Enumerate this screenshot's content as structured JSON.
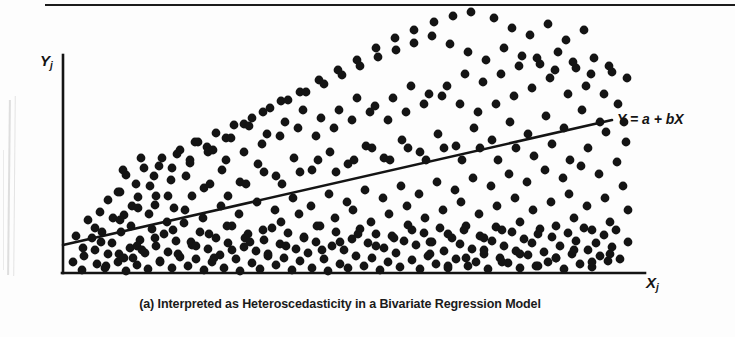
{
  "figure": {
    "caption": "(a) Interpreted as Heteroscedasticity in a Bivariate Regression Model",
    "line_equation": "Y = a + bX",
    "y_axis_label": "Y",
    "y_axis_subscript": "j",
    "x_axis_label": "X",
    "x_axis_subscript": "j",
    "ink_color": "#141414",
    "background_color": "#fdfdfd"
  },
  "chart_data": {
    "type": "scatter",
    "title": "",
    "subtitle": "(a) Interpreted as Heteroscedasticity in a Bivariate Regression Model",
    "xlabel": "X_j",
    "ylabel": "Y_j",
    "grid": false,
    "legend": false,
    "annotations": [
      {
        "text": "Y = a + bX",
        "x": 617,
        "y": 118,
        "role": "regression-line-label"
      }
    ],
    "axes": {
      "x_axis_pixels": {
        "x0": 63,
        "x1": 645,
        "y": 273
      },
      "y_axis_pixels": {
        "x": 63,
        "y0": 55,
        "y1": 273
      },
      "xlim": [
        0,
        100
      ],
      "ylim": [
        0,
        100
      ],
      "ticks": false
    },
    "regression_line": {
      "label": "Y = a + bX",
      "intercept_pixel": {
        "x": 63,
        "y": 245
      },
      "endpoint_pixel": {
        "x": 612,
        "y": 120
      },
      "stroke_width": 2.6,
      "color": "#141414"
    },
    "marker": {
      "shape": "circle",
      "radius_px": 4.4,
      "color": "#141414"
    },
    "points": [
      [
        73,
        262
      ],
      [
        84,
        256
      ],
      [
        82,
        270
      ],
      [
        95,
        250
      ],
      [
        97,
        264
      ],
      [
        92,
        238
      ],
      [
        105,
        268
      ],
      [
        108,
        254
      ],
      [
        112,
        243
      ],
      [
        118,
        262
      ],
      [
        121,
        232
      ],
      [
        126,
        271
      ],
      [
        130,
        248
      ],
      [
        133,
        258
      ],
      [
        124,
        215
      ],
      [
        137,
        265
      ],
      [
        140,
        240
      ],
      [
        145,
        253
      ],
      [
        148,
        269
      ],
      [
        152,
        229
      ],
      [
        138,
        197
      ],
      [
        156,
        246
      ],
      [
        160,
        261
      ],
      [
        164,
        234
      ],
      [
        168,
        252
      ],
      [
        172,
        268
      ],
      [
        176,
        241
      ],
      [
        180,
        257
      ],
      [
        155,
        205
      ],
      [
        184,
        223
      ],
      [
        188,
        266
      ],
      [
        192,
        245
      ],
      [
        196,
        259
      ],
      [
        200,
        232
      ],
      [
        204,
        270
      ],
      [
        208,
        249
      ],
      [
        171,
        180
      ],
      [
        212,
        262
      ],
      [
        216,
        238
      ],
      [
        220,
        255
      ],
      [
        224,
        268
      ],
      [
        228,
        243
      ],
      [
        232,
        226
      ],
      [
        236,
        259
      ],
      [
        240,
        271
      ],
      [
        190,
        163
      ],
      [
        244,
        247
      ],
      [
        248,
        234
      ],
      [
        252,
        263
      ],
      [
        256,
        251
      ],
      [
        260,
        269
      ],
      [
        264,
        240
      ],
      [
        268,
        256
      ],
      [
        207,
        147
      ],
      [
        272,
        228
      ],
      [
        276,
        265
      ],
      [
        280,
        244
      ],
      [
        284,
        258
      ],
      [
        288,
        233
      ],
      [
        292,
        270
      ],
      [
        296,
        249
      ],
      [
        226,
        138
      ],
      [
        300,
        261
      ],
      [
        304,
        237
      ],
      [
        308,
        253
      ],
      [
        312,
        268
      ],
      [
        316,
        242
      ],
      [
        320,
        226
      ],
      [
        324,
        259
      ],
      [
        244,
        124
      ],
      [
        328,
        271
      ],
      [
        332,
        246
      ],
      [
        336,
        232
      ],
      [
        340,
        264
      ],
      [
        344,
        250
      ],
      [
        348,
        268
      ],
      [
        352,
        239
      ],
      [
        263,
        112
      ],
      [
        356,
        256
      ],
      [
        360,
        229
      ],
      [
        364,
        266
      ],
      [
        368,
        243
      ],
      [
        372,
        258
      ],
      [
        376,
        234
      ],
      [
        380,
        270
      ],
      [
        281,
        101
      ],
      [
        384,
        248
      ],
      [
        388,
        262
      ],
      [
        392,
        236
      ],
      [
        396,
        253
      ],
      [
        400,
        267
      ],
      [
        404,
        241
      ],
      [
        300,
        92
      ],
      [
        408,
        225
      ],
      [
        412,
        260
      ],
      [
        416,
        245
      ],
      [
        420,
        269
      ],
      [
        424,
        233
      ],
      [
        428,
        256
      ],
      [
        319,
        80
      ],
      [
        432,
        242
      ],
      [
        436,
        264
      ],
      [
        440,
        228
      ],
      [
        444,
        251
      ],
      [
        448,
        268
      ],
      [
        452,
        238
      ],
      [
        338,
        70
      ],
      [
        456,
        259
      ],
      [
        460,
        244
      ],
      [
        464,
        230
      ],
      [
        468,
        266
      ],
      [
        472,
        249
      ],
      [
        476,
        262
      ],
      [
        357,
        60
      ],
      [
        480,
        236
      ],
      [
        484,
        254
      ],
      [
        488,
        269
      ],
      [
        492,
        241
      ],
      [
        496,
        227
      ],
      [
        500,
        258
      ],
      [
        376,
        48
      ],
      [
        504,
        246
      ],
      [
        508,
        263
      ],
      [
        512,
        232
      ],
      [
        516,
        251
      ],
      [
        520,
        268
      ],
      [
        524,
        239
      ],
      [
        395,
        38
      ],
      [
        528,
        255
      ],
      [
        532,
        243
      ],
      [
        536,
        266
      ],
      [
        540,
        229
      ],
      [
        544,
        252
      ],
      [
        548,
        262
      ],
      [
        414,
        30
      ],
      [
        552,
        237
      ],
      [
        556,
        258
      ],
      [
        560,
        246
      ],
      [
        564,
        269
      ],
      [
        568,
        233
      ],
      [
        572,
        254
      ],
      [
        434,
        22
      ],
      [
        576,
        241
      ],
      [
        580,
        264
      ],
      [
        584,
        228
      ],
      [
        588,
        250
      ],
      [
        592,
        267
      ],
      [
        596,
        243
      ],
      [
        453,
        16
      ],
      [
        600,
        256
      ],
      [
        604,
        235
      ],
      [
        608,
        261
      ],
      [
        612,
        247
      ],
      [
        616,
        230
      ],
      [
        620,
        259
      ],
      [
        471,
        12
      ],
      [
        494,
        18
      ],
      [
        512,
        28
      ],
      [
        530,
        35
      ],
      [
        548,
        24
      ],
      [
        566,
        40
      ],
      [
        584,
        30
      ],
      [
        126,
        175
      ],
      [
        144,
        168
      ],
      [
        162,
        158
      ],
      [
        180,
        150
      ],
      [
        198,
        142
      ],
      [
        216,
        133
      ],
      [
        234,
        125
      ],
      [
        252,
        118
      ],
      [
        270,
        108
      ],
      [
        288,
        100
      ],
      [
        306,
        92
      ],
      [
        324,
        84
      ],
      [
        342,
        75
      ],
      [
        360,
        66
      ],
      [
        378,
        57
      ],
      [
        396,
        50
      ],
      [
        414,
        43
      ],
      [
        432,
        36
      ],
      [
        450,
        44
      ],
      [
        468,
        52
      ],
      [
        486,
        60
      ],
      [
        504,
        48
      ],
      [
        522,
        56
      ],
      [
        540,
        64
      ],
      [
        558,
        52
      ],
      [
        576,
        68
      ],
      [
        594,
        58
      ],
      [
        612,
        72
      ],
      [
        108,
        200
      ],
      [
        120,
        192
      ],
      [
        132,
        206
      ],
      [
        150,
        186
      ],
      [
        168,
        196
      ],
      [
        186,
        176
      ],
      [
        204,
        188
      ],
      [
        222,
        170
      ],
      [
        240,
        182
      ],
      [
        258,
        164
      ],
      [
        276,
        176
      ],
      [
        294,
        158
      ],
      [
        312,
        170
      ],
      [
        330,
        152
      ],
      [
        348,
        164
      ],
      [
        366,
        146
      ],
      [
        384,
        158
      ],
      [
        402,
        140
      ],
      [
        420,
        152
      ],
      [
        438,
        134
      ],
      [
        456,
        146
      ],
      [
        474,
        128
      ],
      [
        492,
        140
      ],
      [
        510,
        122
      ],
      [
        528,
        134
      ],
      [
        546,
        116
      ],
      [
        564,
        128
      ],
      [
        582,
        110
      ],
      [
        600,
        122
      ],
      [
        618,
        104
      ],
      [
        604,
        94
      ],
      [
        586,
        86
      ],
      [
        568,
        94
      ],
      [
        550,
        78
      ],
      [
        532,
        88
      ],
      [
        514,
        96
      ],
      [
        496,
        104
      ],
      [
        478,
        112
      ],
      [
        460,
        104
      ],
      [
        442,
        96
      ],
      [
        424,
        104
      ],
      [
        406,
        112
      ],
      [
        388,
        120
      ],
      [
        370,
        112
      ],
      [
        352,
        120
      ],
      [
        334,
        128
      ],
      [
        316,
        136
      ],
      [
        298,
        128
      ],
      [
        280,
        136
      ],
      [
        262,
        144
      ],
      [
        244,
        152
      ],
      [
        226,
        160
      ],
      [
        208,
        152
      ],
      [
        190,
        160
      ],
      [
        172,
        168
      ],
      [
        154,
        176
      ],
      [
        136,
        184
      ],
      [
        118,
        192
      ],
      [
        100,
        212
      ],
      [
        88,
        220
      ],
      [
        76,
        236
      ],
      [
        95,
        228
      ],
      [
        113,
        218
      ],
      [
        131,
        226
      ],
      [
        149,
        214
      ],
      [
        167,
        222
      ],
      [
        185,
        210
      ],
      [
        203,
        218
      ],
      [
        221,
        206
      ],
      [
        239,
        214
      ],
      [
        257,
        202
      ],
      [
        275,
        210
      ],
      [
        293,
        198
      ],
      [
        311,
        206
      ],
      [
        329,
        194
      ],
      [
        347,
        202
      ],
      [
        365,
        190
      ],
      [
        383,
        198
      ],
      [
        401,
        186
      ],
      [
        419,
        194
      ],
      [
        437,
        182
      ],
      [
        455,
        190
      ],
      [
        473,
        178
      ],
      [
        491,
        186
      ],
      [
        509,
        174
      ],
      [
        527,
        182
      ],
      [
        545,
        170
      ],
      [
        563,
        178
      ],
      [
        581,
        166
      ],
      [
        599,
        174
      ],
      [
        617,
        162
      ],
      [
        623,
        186
      ],
      [
        605,
        198
      ],
      [
        587,
        206
      ],
      [
        569,
        194
      ],
      [
        551,
        202
      ],
      [
        533,
        210
      ],
      [
        515,
        198
      ],
      [
        497,
        206
      ],
      [
        479,
        214
      ],
      [
        461,
        202
      ],
      [
        443,
        210
      ],
      [
        425,
        218
      ],
      [
        407,
        206
      ],
      [
        389,
        214
      ],
      [
        371,
        222
      ],
      [
        353,
        210
      ],
      [
        335,
        218
      ],
      [
        317,
        226
      ],
      [
        299,
        214
      ],
      [
        281,
        222
      ],
      [
        263,
        230
      ],
      [
        245,
        238
      ],
      [
        227,
        226
      ],
      [
        209,
        234
      ],
      [
        191,
        242
      ],
      [
        173,
        230
      ],
      [
        155,
        238
      ],
      [
        137,
        246
      ],
      [
        119,
        254
      ],
      [
        101,
        242
      ],
      [
        83,
        248
      ],
      [
        628,
        210
      ],
      [
        610,
        222
      ],
      [
        592,
        230
      ],
      [
        574,
        218
      ],
      [
        556,
        226
      ],
      [
        538,
        234
      ],
      [
        520,
        222
      ],
      [
        502,
        230
      ],
      [
        484,
        238
      ],
      [
        466,
        226
      ],
      [
        448,
        234
      ],
      [
        430,
        242
      ],
      [
        412,
        230
      ],
      [
        394,
        238
      ],
      [
        376,
        246
      ],
      [
        358,
        234
      ],
      [
        340,
        242
      ],
      [
        322,
        250
      ],
      [
        304,
        238
      ],
      [
        286,
        246
      ],
      [
        268,
        254
      ],
      [
        250,
        242
      ],
      [
        232,
        250
      ],
      [
        214,
        258
      ],
      [
        196,
        246
      ],
      [
        178,
        254
      ],
      [
        160,
        262
      ],
      [
        142,
        250
      ],
      [
        124,
        258
      ],
      [
        106,
        266
      ],
      [
        628,
        242
      ],
      [
        610,
        254
      ],
      [
        592,
        262
      ],
      [
        574,
        250
      ],
      [
        556,
        258
      ],
      [
        538,
        266
      ],
      [
        520,
        254
      ],
      [
        502,
        262
      ],
      [
        484,
        250
      ],
      [
        466,
        258
      ],
      [
        448,
        266
      ],
      [
        430,
        254
      ],
      [
        626,
        142
      ],
      [
        624,
        122
      ],
      [
        606,
        132
      ],
      [
        588,
        148
      ],
      [
        570,
        160
      ],
      [
        552,
        144
      ],
      [
        534,
        156
      ],
      [
        516,
        148
      ],
      [
        498,
        160
      ],
      [
        480,
        148
      ],
      [
        462,
        160
      ],
      [
        444,
        148
      ],
      [
        426,
        160
      ],
      [
        408,
        148
      ],
      [
        390,
        160
      ],
      [
        372,
        148
      ],
      [
        354,
        160
      ],
      [
        336,
        172
      ],
      [
        318,
        160
      ],
      [
        300,
        172
      ],
      [
        282,
        184
      ],
      [
        264,
        172
      ],
      [
        246,
        184
      ],
      [
        228,
        196
      ],
      [
        210,
        184
      ],
      [
        192,
        196
      ],
      [
        174,
        208
      ],
      [
        156,
        196
      ],
      [
        138,
        208
      ],
      [
        120,
        220
      ],
      [
        102,
        232
      ],
      [
        627,
        78
      ],
      [
        609,
        66
      ],
      [
        591,
        74
      ],
      [
        573,
        62
      ],
      [
        555,
        70
      ],
      [
        537,
        58
      ],
      [
        519,
        66
      ],
      [
        501,
        74
      ],
      [
        483,
        82
      ],
      [
        465,
        74
      ],
      [
        447,
        86
      ],
      [
        429,
        94
      ],
      [
        411,
        86
      ],
      [
        393,
        98
      ],
      [
        375,
        106
      ],
      [
        357,
        98
      ],
      [
        339,
        110
      ],
      [
        321,
        118
      ],
      [
        303,
        110
      ],
      [
        285,
        122
      ],
      [
        267,
        134
      ],
      [
        249,
        126
      ],
      [
        231,
        138
      ],
      [
        213,
        150
      ],
      [
        195,
        142
      ],
      [
        177,
        154
      ],
      [
        159,
        166
      ],
      [
        141,
        158
      ],
      [
        123,
        170
      ]
    ]
  }
}
